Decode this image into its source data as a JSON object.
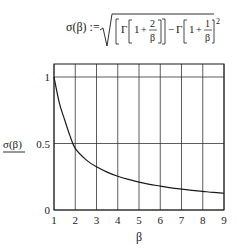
{
  "formula": {
    "lhs": "σ(β) :=",
    "gamma": "Γ",
    "one": "1",
    "plus": "+",
    "num1": "2",
    "num2": "1",
    "den": "β",
    "minus": "−",
    "exponent": "2"
  },
  "chart_data": {
    "type": "line",
    "xlabel": "β",
    "ylabel": "σ(β)",
    "xlim": [
      1,
      9
    ],
    "ylim": [
      0,
      1.1
    ],
    "x_ticks": [
      "1",
      "2",
      "3",
      "4",
      "5",
      "6",
      "7",
      "8",
      "9"
    ],
    "y_ticks": [
      "0",
      "0.5",
      "1"
    ],
    "grid": true,
    "legend": "none",
    "series": [
      {
        "name": "σ(β)",
        "x": [
          1,
          1.25,
          1.5,
          1.75,
          2,
          2.5,
          3,
          3.5,
          4,
          4.5,
          5,
          5.5,
          6,
          6.5,
          7,
          7.5,
          8,
          8.5,
          9
        ],
        "values": [
          1.0,
          0.805,
          0.679,
          0.559,
          0.463,
          0.379,
          0.325,
          0.285,
          0.254,
          0.23,
          0.21,
          0.193,
          0.18,
          0.167,
          0.157,
          0.148,
          0.14,
          0.132,
          0.126
        ]
      }
    ]
  }
}
